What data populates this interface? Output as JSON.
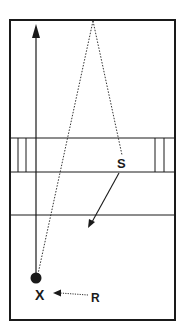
{
  "diagram": {
    "type": "court-drill",
    "labels": {
      "setter": "S",
      "player_x": "X",
      "receiver": "R"
    },
    "colors": {
      "line": "#1a1a1a",
      "background": "#ffffff"
    },
    "elements": {
      "court": "rectangle-court",
      "net_band": "center-band-with-posts",
      "attack_line": "horizontal-line",
      "ball": "filled-circle",
      "arrows": [
        "vertical-solid-arrow-up",
        "solid-arrow-from-S",
        "dotted-arrow-R-to-X"
      ],
      "dotted_paths": [
        "dotted-triangle-apex-top"
      ]
    }
  }
}
